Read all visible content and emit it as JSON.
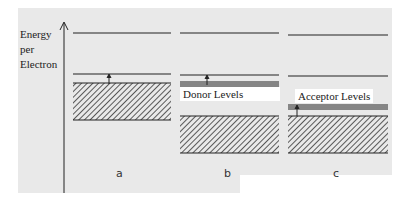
{
  "axis": {
    "label_lines": [
      "Energy",
      "per",
      "Electron"
    ]
  },
  "panels": [
    {
      "letter": "a",
      "description": "Intrinsic semiconductor"
    },
    {
      "letter": "b",
      "label": "Donor Levels"
    },
    {
      "letter": "c",
      "label": "Acceptor Levels"
    }
  ],
  "colors": {
    "line": "#222222",
    "background": "#e9e9e9"
  }
}
